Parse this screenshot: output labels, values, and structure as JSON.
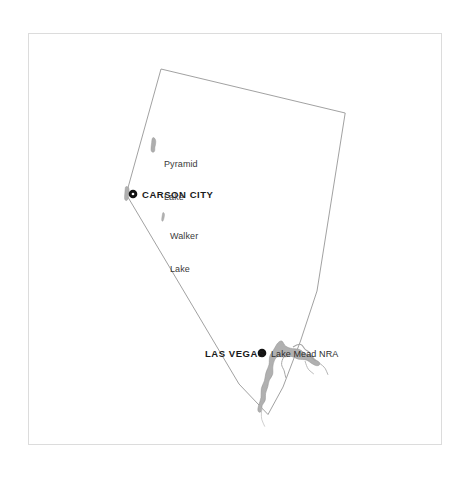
{
  "map": {
    "title": "Nevada",
    "background_color": "#ffffff",
    "frame": {
      "name": "map-frame",
      "stroke_color": "#d8d8d8",
      "x": 28,
      "y": 33,
      "width": 414,
      "height": 412
    },
    "state_outline": {
      "name": "nevada-state-boundary",
      "stroke_color": "#8a8a8a",
      "fill_color": "#ffffff",
      "stroke_width": 0.8
    },
    "water_color": "#a8a8a8",
    "water_stroke_color": "#8f8f8f",
    "marker_color": "#111111",
    "cities": [
      {
        "name": "carson-city",
        "label": "CARSON CITY",
        "type": "capital",
        "dot_x": 133,
        "dot_y": 194,
        "label_x": 142,
        "label_y": 190
      },
      {
        "name": "las-vegas",
        "label": "LAS VEGAS",
        "type": "city",
        "dot_x": 262,
        "dot_y": 353,
        "label_x": 205,
        "label_y": 349
      }
    ],
    "water_labels": [
      {
        "name": "pyramid-lake",
        "line1": "Pyramid",
        "line2": "Lake",
        "label_x": 164,
        "label_y": 138
      },
      {
        "name": "walker-lake",
        "line1": "Walker",
        "line2": "Lake",
        "label_x": 170,
        "label_y": 210
      }
    ],
    "park_labels": [
      {
        "name": "lake-mead-nra",
        "label": "Lake Mead NRA",
        "label_x": 271,
        "label_y": 350
      }
    ]
  }
}
